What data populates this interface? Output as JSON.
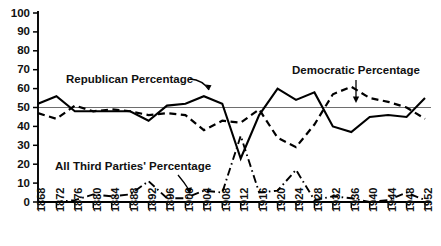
{
  "chart_data": {
    "type": "line",
    "title": "",
    "xlabel": "",
    "ylabel": "",
    "ylim": [
      0,
      100
    ],
    "yticks": [
      0,
      10,
      20,
      30,
      40,
      50,
      60,
      70,
      80,
      90,
      100
    ],
    "grid": false,
    "reference_line": 50,
    "legend_position": "inline-annotations",
    "x": [
      1868,
      1872,
      1876,
      1880,
      1884,
      1888,
      1892,
      1896,
      1900,
      1904,
      1908,
      1912,
      1916,
      1920,
      1924,
      1928,
      1932,
      1936,
      1940,
      1944,
      1948,
      1952
    ],
    "xtick_labels": [
      "1868",
      "1872",
      "1876",
      "1880",
      "1884",
      "1888",
      "1892",
      "1896",
      "1900",
      "1904",
      "1908",
      "1912",
      "1916",
      "1920",
      "1924",
      "1928",
      "1932",
      "1936",
      "1940",
      "1944",
      "1948",
      "1952"
    ],
    "series": [
      {
        "name": "Republican Percentage",
        "style": "solid",
        "values": [
          52,
          56,
          48,
          48,
          48,
          48,
          43,
          51,
          52,
          56,
          52,
          23,
          46,
          60,
          54,
          58,
          40,
          37,
          45,
          46,
          45,
          55
        ]
      },
      {
        "name": "Democratic Percentage",
        "style": "dashed",
        "values": [
          47,
          44,
          51,
          48,
          49,
          48,
          46,
          47,
          46,
          38,
          43,
          42,
          49,
          34,
          29,
          41,
          57,
          61,
          55,
          53,
          50,
          44
        ]
      },
      {
        "name": "All Third Parties' Percentage",
        "style": "dash-dot",
        "values": [
          0,
          0,
          1,
          4,
          3,
          4,
          11,
          2,
          2,
          6,
          5,
          35,
          5,
          6,
          17,
          1,
          3,
          2,
          0,
          1,
          5,
          1
        ]
      }
    ],
    "annotations": [
      {
        "text": "Republican Percentage",
        "target_year": 1904,
        "target_value": 56
      },
      {
        "text": "Democratic Percentage",
        "target_year": 1936,
        "target_value": 61
      },
      {
        "text": "All Third Parties' Percentage",
        "target_year": 1896,
        "target_value": 2
      }
    ]
  }
}
